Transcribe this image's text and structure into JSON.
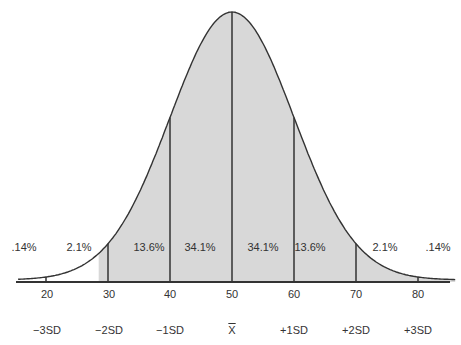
{
  "chart_data": {
    "type": "area",
    "title": "",
    "xlabel": "",
    "ylabel": "",
    "mean": 50,
    "sd": 10,
    "xlim": [
      17,
      86
    ],
    "x_ticks": [
      20,
      30,
      40,
      50,
      60,
      70,
      80
    ],
    "x_tick_labels": [
      "20",
      "30",
      "40",
      "50",
      "60",
      "70",
      "80"
    ],
    "sd_labels": [
      "−3SD",
      "−2SD",
      "−1SD",
      "X̅",
      "+1SD",
      "+2SD",
      "+3SD"
    ],
    "bands": [
      {
        "range": "< -3SD",
        "label": ".14%",
        "value": 0.14
      },
      {
        "range": "-3SD to -2SD",
        "label": "2.1%",
        "value": 2.1
      },
      {
        "range": "-2SD to -1SD",
        "label": "13.6%",
        "value": 13.6
      },
      {
        "range": "-1SD to mean",
        "label": "34.1%",
        "value": 34.1
      },
      {
        "range": "mean to +1SD",
        "label": "34.1%",
        "value": 34.1
      },
      {
        "range": "+1SD to +2SD",
        "label": "13.6%",
        "value": 13.6
      },
      {
        "range": "+2SD to +3SD",
        "label": "2.1%",
        "value": 2.1
      },
      {
        "range": "> +3SD",
        "label": ".14%",
        "value": 0.14
      }
    ],
    "vertical_lines_at": [
      20,
      30,
      40,
      50,
      60,
      70,
      80
    ],
    "fill_color": "#d8d8d8",
    "line_color": "#333333",
    "grid": false,
    "legend": "none"
  },
  "labels": {
    "pct": [
      ".14%",
      "2.1%",
      "13.6%",
      "34.1%",
      "34.1%",
      "13.6%",
      "2.1%",
      ".14%"
    ],
    "ticks": [
      "20",
      "30",
      "40",
      "50",
      "60",
      "70",
      "80"
    ],
    "sd": [
      "−3SD",
      "−2SD",
      "−1SD",
      "X",
      "+1SD",
      "+2SD",
      "+3SD"
    ]
  }
}
